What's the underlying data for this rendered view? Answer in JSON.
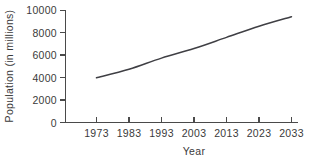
{
  "chart_data": {
    "type": "line",
    "title": "",
    "xlabel": "Year",
    "ylabel": "Population (in millions)",
    "x": [
      1973,
      1983,
      1993,
      2003,
      2013,
      2023,
      2033
    ],
    "values": [
      4000,
      4750,
      5750,
      6600,
      7600,
      8600,
      9450
    ],
    "series": [
      {
        "name": "Population",
        "values": [
          4000,
          4750,
          5750,
          6600,
          7600,
          8600,
          9450
        ]
      }
    ],
    "x_tick_labels": [
      "1973",
      "1983",
      "1993",
      "2003",
      "2013",
      "2023",
      "2033"
    ],
    "y_tick_labels": [
      "0",
      "2000",
      "4000",
      "6000",
      "8000",
      "10000"
    ],
    "y_ticks": [
      0,
      2000,
      4000,
      6000,
      8000,
      10000
    ],
    "xlim": [
      1973,
      2033
    ],
    "ylim": [
      0,
      10000
    ],
    "grid": false,
    "legend": false,
    "line_color": "#3f3f44",
    "axis_color": "#4a4a4a",
    "background_color": "#ffffff"
  },
  "labels": {
    "y_axis_title": "Population (in millions)",
    "x_axis_title": "Year",
    "y0": "0",
    "y1": "2000",
    "y2": "4000",
    "y3": "6000",
    "y4": "8000",
    "y5": "10000",
    "x0": "1973",
    "x1": "1983",
    "x2": "1993",
    "x3": "2003",
    "x4": "2013",
    "x5": "2023",
    "x6": "2033"
  }
}
